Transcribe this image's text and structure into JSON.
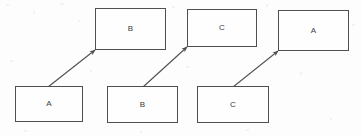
{
  "diagram": {
    "type": "directed-graph",
    "background_color": "#fdfdfd",
    "stroke_color": "#4f4f4f",
    "text_color": "#3c3c3c",
    "canvas": {
      "width": 361,
      "height": 136
    },
    "nodes": [
      {
        "id": "top-b",
        "label": "B",
        "x": 95,
        "y": 8,
        "width": 71,
        "height": 42,
        "row": "top"
      },
      {
        "id": "top-c",
        "label": "C",
        "x": 187,
        "y": 9,
        "width": 70,
        "height": 38,
        "row": "top"
      },
      {
        "id": "top-a",
        "label": "A",
        "x": 278,
        "y": 10,
        "width": 71,
        "height": 41,
        "row": "top"
      },
      {
        "id": "bottom-a",
        "label": "A",
        "x": 15,
        "y": 86,
        "width": 68,
        "height": 36,
        "row": "bottom"
      },
      {
        "id": "bottom-b",
        "label": "B",
        "x": 107,
        "y": 86,
        "width": 71,
        "height": 37,
        "row": "bottom"
      },
      {
        "id": "bottom-c",
        "label": "C",
        "x": 197,
        "y": 86,
        "width": 72,
        "height": 37,
        "row": "bottom"
      }
    ],
    "edges": [
      {
        "id": "edge-a-to-b",
        "from": "bottom-a",
        "to": "top-b",
        "x1": 48,
        "y1": 87,
        "x2": 95,
        "y2": 50,
        "arrowhead": "end"
      },
      {
        "id": "edge-b-to-c",
        "from": "bottom-b",
        "to": "top-c",
        "x1": 143,
        "y1": 87,
        "x2": 187,
        "y2": 47,
        "arrowhead": "end"
      },
      {
        "id": "edge-c-to-a",
        "from": "bottom-c",
        "to": "top-a",
        "x1": 233,
        "y1": 87,
        "x2": 278,
        "y2": 51,
        "arrowhead": "end"
      }
    ]
  }
}
